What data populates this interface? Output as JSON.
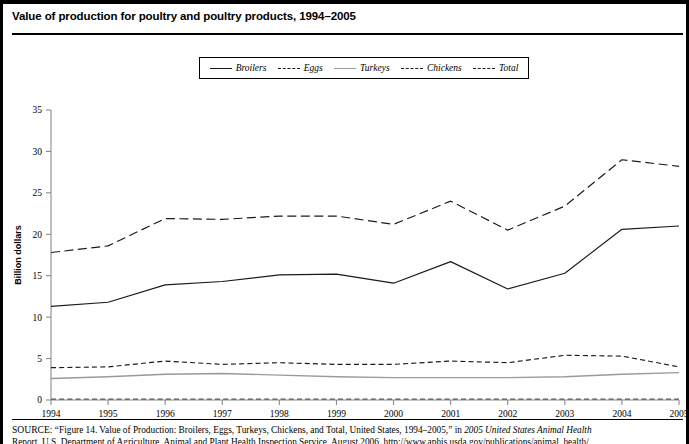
{
  "figure": {
    "title": "Value of production for poultry and poultry products, 1994–2005",
    "ylabel": "Billion dollars"
  },
  "legend": {
    "position": "top-center",
    "items": [
      {
        "label": "Broilers",
        "style": "solid",
        "swatch": "sw-solid"
      },
      {
        "label": "Eggs",
        "style": "dashed",
        "swatch": "sw-dash"
      },
      {
        "label": "Turkeys",
        "style": "solid-light",
        "swatch": "sw-solid-light"
      },
      {
        "label": "Chickens",
        "style": "dashed",
        "swatch": "sw-dash"
      },
      {
        "label": "Total",
        "style": "long-dashed",
        "swatch": "sw-longdash"
      }
    ]
  },
  "source": {
    "keyword": "SOURCE:",
    "line1_a": " “Figure 14. Value of Production: Broilers, Eggs, Turkeys, Chickens, and Total, United States, 1994–2005,” in ",
    "line1_italic": "2005 United States Animal Health",
    "line2": "Report, U.S. Department of Agriculture, Animal and Plant Health Inspection Service, August 2006, http://www.aphis.usda.gov/publications/animal_health/"
  },
  "chart_data": {
    "type": "line",
    "title": "Value of production for poultry and poultry products, 1994–2005",
    "xlabel": "",
    "ylabel": "Billion dollars",
    "xlim": [
      1994,
      2005
    ],
    "ylim": [
      0,
      35
    ],
    "yticks": [
      0,
      5,
      10,
      15,
      20,
      25,
      30,
      35
    ],
    "grid": false,
    "legend_position": "top-center",
    "categories": [
      1994,
      1995,
      1996,
      1997,
      1998,
      1999,
      2000,
      2001,
      2002,
      2003,
      2004,
      2005
    ],
    "xticklabels": [
      "1994",
      "1995",
      "1996",
      "1997",
      "1998",
      "1999",
      "2000",
      "2001",
      "2002",
      "2003",
      "2004",
      "2005"
    ],
    "series": [
      {
        "name": "Broilers",
        "style": "solid",
        "color": "#1a1a1a",
        "values": [
          11.3,
          11.8,
          13.9,
          14.3,
          15.1,
          15.2,
          14.1,
          16.7,
          13.4,
          15.3,
          20.6,
          21.0
        ]
      },
      {
        "name": "Eggs",
        "style": "dashed",
        "color": "#1a1a1a",
        "values": [
          3.9,
          4.0,
          4.7,
          4.3,
          4.5,
          4.3,
          4.3,
          4.7,
          4.5,
          5.4,
          5.3,
          4.0
        ]
      },
      {
        "name": "Turkeys",
        "style": "solid",
        "color": "#9a9a9a",
        "values": [
          2.6,
          2.8,
          3.1,
          3.2,
          3.0,
          2.8,
          2.7,
          2.7,
          2.7,
          2.8,
          3.1,
          3.3
        ]
      },
      {
        "name": "Chickens",
        "style": "dashed",
        "color": "#555555",
        "values": [
          0.1,
          0.1,
          0.1,
          0.1,
          0.1,
          0.1,
          0.1,
          0.1,
          0.1,
          0.1,
          0.1,
          0.1
        ]
      },
      {
        "name": "Total",
        "style": "long-dashed",
        "color": "#1a1a1a",
        "values": [
          17.8,
          18.6,
          21.9,
          21.8,
          22.2,
          22.2,
          21.2,
          24.0,
          20.5,
          23.4,
          29.0,
          28.2
        ]
      }
    ]
  }
}
